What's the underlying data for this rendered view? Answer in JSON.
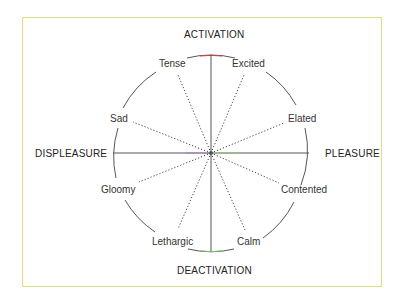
{
  "diagram": {
    "axes": {
      "top": "ACTIVATION",
      "bottom": "DEACTIVATION",
      "left": "DISPLEASURE",
      "right": "PLEASURE"
    },
    "emotions": [
      {
        "label": "Tense",
        "angle_deg": 110
      },
      {
        "label": "Excited",
        "angle_deg": 65
      },
      {
        "label": "Sad",
        "angle_deg": 155
      },
      {
        "label": "Elated",
        "angle_deg": 25
      },
      {
        "label": "Gloomy",
        "angle_deg": 205
      },
      {
        "label": "Contented",
        "angle_deg": 335
      },
      {
        "label": "Lethargic",
        "angle_deg": 245
      },
      {
        "label": "Calm",
        "angle_deg": 295
      }
    ],
    "colors": {
      "border": "#dede8a",
      "lines": "#444444",
      "accent_red": "#d04040",
      "accent_green": "#7ac070"
    }
  }
}
